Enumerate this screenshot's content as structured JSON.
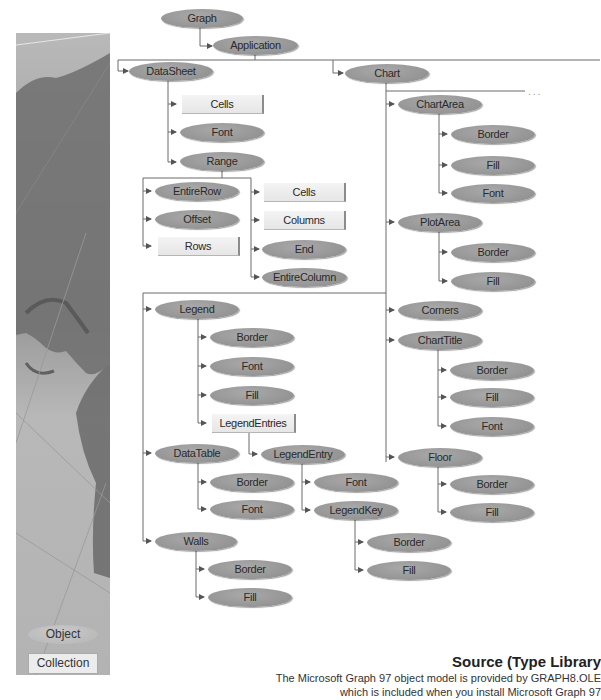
{
  "diagram": {
    "title": "Microsoft Graph 97 Object Model",
    "colors": {
      "object_fill": "#979797",
      "collection_fill": "#eeeeee",
      "connector": "#666666",
      "text": "#2a2a2a"
    },
    "continuation": "...",
    "nodes": {
      "graph": {
        "label": "Graph",
        "type": "object"
      },
      "application": {
        "label": "Application",
        "type": "object"
      },
      "datasheet": {
        "label": "DataSheet",
        "type": "object"
      },
      "ds_cells": {
        "label": "Cells",
        "type": "collection"
      },
      "ds_font": {
        "label": "Font",
        "type": "object"
      },
      "range": {
        "label": "Range",
        "type": "object"
      },
      "entirerow": {
        "label": "EntireRow",
        "type": "object"
      },
      "offset": {
        "label": "Offset",
        "type": "object"
      },
      "rows": {
        "label": "Rows",
        "type": "collection"
      },
      "r_cells": {
        "label": "Cells",
        "type": "collection"
      },
      "columns": {
        "label": "Columns",
        "type": "collection"
      },
      "end": {
        "label": "End",
        "type": "object"
      },
      "entirecolumn": {
        "label": "EntireColumn",
        "type": "object"
      },
      "chart": {
        "label": "Chart",
        "type": "object"
      },
      "chartarea": {
        "label": "ChartArea",
        "type": "object"
      },
      "ca_border": {
        "label": "Border",
        "type": "object"
      },
      "ca_fill": {
        "label": "Fill",
        "type": "object"
      },
      "ca_font": {
        "label": "Font",
        "type": "object"
      },
      "plotarea": {
        "label": "PlotArea",
        "type": "object"
      },
      "pa_border": {
        "label": "Border",
        "type": "object"
      },
      "pa_fill": {
        "label": "Fill",
        "type": "object"
      },
      "legend": {
        "label": "Legend",
        "type": "object"
      },
      "lg_border": {
        "label": "Border",
        "type": "object"
      },
      "lg_font": {
        "label": "Font",
        "type": "object"
      },
      "lg_fill": {
        "label": "Fill",
        "type": "object"
      },
      "legendentries": {
        "label": "LegendEntries",
        "type": "collection"
      },
      "legendentry": {
        "label": "LegendEntry",
        "type": "object"
      },
      "le_font": {
        "label": "Font",
        "type": "object"
      },
      "legendkey": {
        "label": "LegendKey",
        "type": "object"
      },
      "lk_border": {
        "label": "Border",
        "type": "object"
      },
      "lk_fill": {
        "label": "Fill",
        "type": "object"
      },
      "datatable": {
        "label": "DataTable",
        "type": "object"
      },
      "dt_border": {
        "label": "Border",
        "type": "object"
      },
      "dt_font": {
        "label": "Font",
        "type": "object"
      },
      "walls": {
        "label": "Walls",
        "type": "object"
      },
      "w_border": {
        "label": "Border",
        "type": "object"
      },
      "w_fill": {
        "label": "Fill",
        "type": "object"
      },
      "corners": {
        "label": "Corners",
        "type": "object"
      },
      "charttitle": {
        "label": "ChartTitle",
        "type": "object"
      },
      "ct_border": {
        "label": "Border",
        "type": "object"
      },
      "ct_fill": {
        "label": "Fill",
        "type": "object"
      },
      "ct_font": {
        "label": "Font",
        "type": "object"
      },
      "floor": {
        "label": "Floor",
        "type": "object"
      },
      "fl_border": {
        "label": "Border",
        "type": "object"
      },
      "fl_fill": {
        "label": "Fill",
        "type": "object"
      }
    }
  },
  "key": {
    "object_label": "Object",
    "collection_label": "Collection"
  },
  "source": {
    "title": "Source (Type Library",
    "line1": "The Microsoft Graph 97 object model is provided by GRAPH8.OLE",
    "line2": "which is included when you install Microsoft Graph 97"
  }
}
